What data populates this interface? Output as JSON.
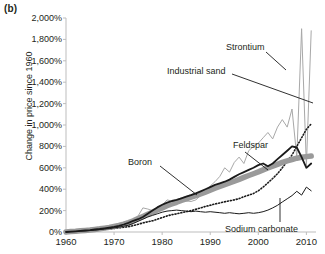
{
  "panel": {
    "label": "(b)"
  },
  "chart_data": {
    "type": "line",
    "title": "",
    "xlabel": "",
    "ylabel": "Change in price since 1960",
    "xlim": [
      1960,
      2012
    ],
    "ylim": [
      0,
      2000
    ],
    "xticks": [
      "1960",
      "1970",
      "1980",
      "1990",
      "2000",
      "2010"
    ],
    "xtick_values": [
      1960,
      1970,
      1980,
      1990,
      2000,
      2010
    ],
    "yticks": [
      "0%",
      "200%",
      "400%",
      "600%",
      "800%",
      "1,000%",
      "1,200%",
      "1,400%",
      "1,600%",
      "1,800%",
      "2,000%"
    ],
    "ytick_values": [
      0,
      200,
      400,
      600,
      800,
      1000,
      1200,
      1400,
      1600,
      1800,
      2000
    ],
    "grid": false,
    "legend": "inline-annotations",
    "x": [
      1960,
      1961,
      1962,
      1963,
      1964,
      1965,
      1966,
      1967,
      1968,
      1969,
      1970,
      1971,
      1972,
      1973,
      1974,
      1975,
      1976,
      1977,
      1978,
      1979,
      1980,
      1981,
      1982,
      1983,
      1984,
      1985,
      1986,
      1987,
      1988,
      1989,
      1990,
      1991,
      1992,
      1993,
      1994,
      1995,
      1996,
      1997,
      1998,
      1999,
      2000,
      2001,
      2002,
      2003,
      2004,
      2005,
      2006,
      2007,
      2008,
      2009,
      2010,
      2011
    ],
    "series": [
      {
        "name": "Strontium",
        "color": "#a8a8a8",
        "style": "solid-thin",
        "values": [
          0,
          5,
          8,
          10,
          14,
          16,
          20,
          24,
          28,
          32,
          38,
          45,
          52,
          60,
          75,
          150,
          225,
          215,
          200,
          215,
          250,
          300,
          290,
          275,
          300,
          290,
          285,
          300,
          340,
          380,
          430,
          470,
          520,
          600,
          560,
          650,
          700,
          640,
          760,
          800,
          830,
          880,
          930,
          870,
          980,
          1050,
          980,
          1150,
          700,
          1900,
          620,
          1880
        ]
      },
      {
        "name": "Industrial sand",
        "color": "#1a1a1a",
        "style": "dotted",
        "values": [
          0,
          3,
          5,
          8,
          10,
          13,
          16,
          20,
          24,
          28,
          33,
          38,
          44,
          50,
          60,
          72,
          85,
          95,
          105,
          120,
          135,
          150,
          162,
          170,
          180,
          190,
          200,
          212,
          225,
          238,
          250,
          262,
          272,
          282,
          292,
          300,
          312,
          330,
          345,
          360,
          385,
          420,
          460,
          500,
          545,
          600,
          660,
          720,
          800,
          880,
          960,
          1010
        ]
      },
      {
        "name": "Feldspar",
        "color": "#9a9a9a",
        "style": "thick-band",
        "values": [
          0,
          4,
          7,
          11,
          15,
          19,
          24,
          30,
          36,
          43,
          52,
          62,
          74,
          88,
          105,
          125,
          145,
          165,
          185,
          205,
          225,
          245,
          262,
          278,
          295,
          310,
          325,
          340,
          355,
          372,
          390,
          408,
          425,
          442,
          458,
          475,
          492,
          510,
          528,
          545,
          562,
          580,
          598,
          615,
          632,
          650,
          665,
          678,
          690,
          698,
          705,
          710
        ]
      },
      {
        "name": "Boron",
        "color": "#1a1a1a",
        "style": "solid-bold",
        "values": [
          0,
          4,
          7,
          10,
          14,
          18,
          23,
          28,
          34,
          40,
          48,
          58,
          70,
          85,
          105,
          120,
          140,
          170,
          200,
          230,
          255,
          275,
          290,
          300,
          315,
          330,
          345,
          362,
          380,
          400,
          420,
          440,
          455,
          470,
          490,
          515,
          540,
          560,
          580,
          600,
          625,
          640,
          615,
          640,
          680,
          720,
          760,
          800,
          790,
          700,
          600,
          640
        ]
      },
      {
        "name": "Sodium carbonate",
        "color": "#1a1a1a",
        "style": "solid-thin",
        "values": [
          0,
          3,
          5,
          8,
          11,
          14,
          18,
          22,
          27,
          32,
          38,
          45,
          54,
          64,
          80,
          100,
          120,
          140,
          155,
          170,
          185,
          195,
          200,
          205,
          200,
          195,
          190,
          195,
          190,
          185,
          190,
          185,
          180,
          175,
          180,
          175,
          170,
          175,
          180,
          175,
          180,
          190,
          205,
          225,
          250,
          280,
          310,
          340,
          380,
          345,
          420,
          385
        ]
      }
    ],
    "annotations": [
      {
        "text": "Strontium",
        "series": "Strontium"
      },
      {
        "text": "Industrial sand",
        "series": "Industrial sand"
      },
      {
        "text": "Feldspar",
        "series": "Feldspar"
      },
      {
        "text": "Boron",
        "series": "Boron"
      },
      {
        "text": "Sodium carbonate",
        "series": "Sodium carbonate"
      }
    ]
  }
}
